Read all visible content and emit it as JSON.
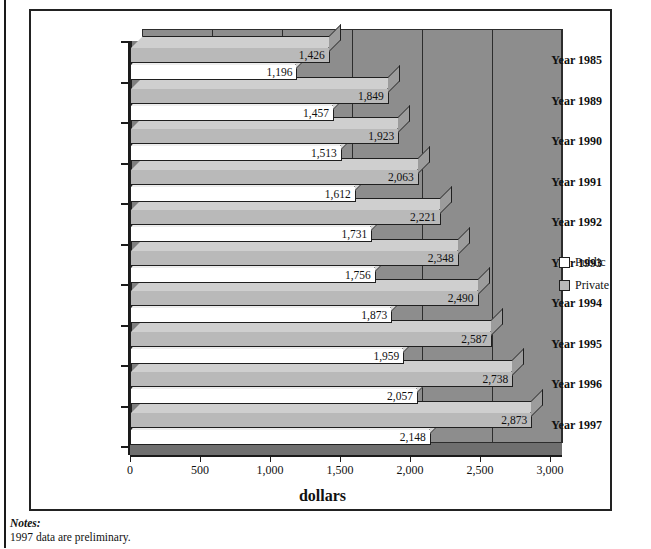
{
  "chart_data": {
    "type": "bar",
    "orientation": "horizontal",
    "grouped": true,
    "title": "",
    "xlabel": "dollars",
    "ylabel": "",
    "xlim": [
      0,
      3000
    ],
    "xticks": [
      "0",
      "500",
      "1,000",
      "1,500",
      "2,000",
      "2,500",
      "3,000"
    ],
    "xtick_values": [
      0,
      500,
      1000,
      1500,
      2000,
      2500,
      3000
    ],
    "grid": true,
    "legend_position": "right",
    "categories": [
      "Year 1985",
      "Year 1989",
      "Year 1990",
      "Year 1991",
      "Year 1992",
      "Year 1993",
      "Year 1994",
      "Year 1995",
      "Year 1996",
      "Year 1997"
    ],
    "series": [
      {
        "name": "Private",
        "color": "#b9b9b9",
        "values": [
          1426,
          1849,
          1923,
          2063,
          2221,
          2348,
          2490,
          2587,
          2738,
          2873
        ],
        "labels": [
          "1,426",
          "1,849",
          "1,923",
          "2,063",
          "2,221",
          "2,348",
          "2,490",
          "2,587",
          "2,738",
          "2,873"
        ]
      },
      {
        "name": "Public",
        "color": "#ffffff",
        "values": [
          1196,
          1457,
          1513,
          1612,
          1731,
          1756,
          1873,
          1959,
          2057,
          2148
        ],
        "labels": [
          "1,196",
          "1,457",
          "1,513",
          "1,612",
          "1,731",
          "1,756",
          "1,873",
          "1,959",
          "2,057",
          "2,148"
        ]
      }
    ]
  },
  "legend": {
    "items": [
      {
        "label": "Public",
        "swatch": "#ffffff"
      },
      {
        "label": "Private",
        "swatch": "#b9b9b9"
      }
    ]
  },
  "notes": {
    "title": "Notes:",
    "lines": [
      "1997 data are preliminary."
    ]
  }
}
